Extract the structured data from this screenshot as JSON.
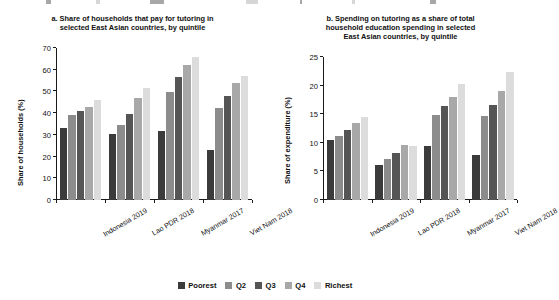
{
  "figure": {
    "background": "#ffffff",
    "series_colors": [
      "#3b3b3b",
      "#8c8c8c",
      "#555555",
      "#a8a8a8",
      "#dcdcdc"
    ]
  },
  "legend": {
    "position": "bottom-center",
    "items": [
      {
        "label": "Poorest",
        "color": "#3b3b3b"
      },
      {
        "label": "Q2",
        "color": "#8c8c8c"
      },
      {
        "label": "Q3",
        "color": "#555555"
      },
      {
        "label": "Q4",
        "color": "#a8a8a8"
      },
      {
        "label": "Richest",
        "color": "#dcdcdc"
      }
    ]
  },
  "chart_data": [
    {
      "type": "bar",
      "panel": "a",
      "title": "a. Share of households that pay for tutoring in selected East Asian countries, by quintile",
      "title_lines": [
        "a. Share of households that pay for tutoring in",
        "selected East Asian countries, by quintile"
      ],
      "xlabel": "",
      "ylabel": "Share of households (%)",
      "ylim": [
        0,
        70
      ],
      "yticks": [
        0,
        10,
        20,
        30,
        40,
        50,
        60,
        70
      ],
      "grid": false,
      "categories": [
        "Indonesia 2019",
        "Lao PDR 2018",
        "Myanmar 2017",
        "Viet Nam 2018"
      ],
      "series": [
        {
          "name": "Poorest",
          "color": "#3b3b3b",
          "values": [
            33.3,
            30.2,
            31.7,
            22.9
          ]
        },
        {
          "name": "Q2",
          "color": "#8c8c8c",
          "values": [
            39.0,
            34.6,
            49.7,
            42.3
          ]
        },
        {
          "name": "Q3",
          "color": "#555555",
          "values": [
            41.0,
            39.7,
            56.7,
            48.0
          ]
        },
        {
          "name": "Q4",
          "color": "#a8a8a8",
          "values": [
            43.0,
            47.2,
            62.2,
            53.8
          ]
        },
        {
          "name": "Richest",
          "color": "#dcdcdc",
          "values": [
            46.0,
            51.6,
            66.0,
            57.2
          ]
        }
      ]
    },
    {
      "type": "bar",
      "panel": "b",
      "title": "b. Spending on tutoring as a share of total household education spending in selected East Asian countries, by quintile",
      "title_lines": [
        "b. Spending on tutoring as a share of total",
        "household education spending in selected",
        "East Asian countries, by quintile"
      ],
      "xlabel": "",
      "ylabel": "Share of expenditure (%)",
      "ylim": [
        0,
        25
      ],
      "yticks": [
        0,
        5,
        10,
        15,
        20,
        25
      ],
      "grid": false,
      "categories": [
        "Indonesia 2019",
        "Lao PDR 2018",
        "Myanmar 2017",
        "Viet Nam 2018"
      ],
      "series": [
        {
          "name": "Poorest",
          "color": "#3b3b3b",
          "values": [
            10.5,
            6.2,
            9.5,
            7.9
          ]
        },
        {
          "name": "Q2",
          "color": "#8c8c8c",
          "values": [
            11.2,
            7.1,
            14.8,
            14.7
          ]
        },
        {
          "name": "Q3",
          "color": "#555555",
          "values": [
            12.2,
            8.3,
            16.4,
            16.6
          ]
        },
        {
          "name": "Q4",
          "color": "#a8a8a8",
          "values": [
            13.5,
            9.6,
            18.0,
            19.1
          ]
        },
        {
          "name": "Richest",
          "color": "#dcdcdc",
          "values": [
            14.6,
            9.4,
            20.2,
            22.3
          ]
        }
      ]
    }
  ]
}
